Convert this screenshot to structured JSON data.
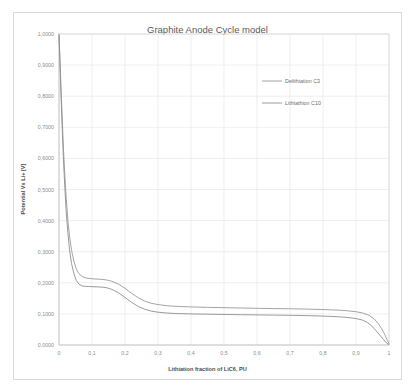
{
  "chart_data": {
    "type": "line",
    "title": "Graphite Anode Cycle model",
    "xlabel": "Lithiation fraction of LiC6, PU",
    "ylabel": "Potential Vs Li+ [V]",
    "xlim": [
      0,
      1
    ],
    "ylim": [
      0,
      1
    ],
    "grid": true,
    "legend_position": "inside-top-right",
    "xticks": [
      "0",
      "0,1",
      "0,2",
      "0,3",
      "0,4",
      "0,5",
      "0,6",
      "0,7",
      "0,8",
      "0,9",
      "1"
    ],
    "xtick_values": [
      0,
      0.1,
      0.2,
      0.3,
      0.4,
      0.5,
      0.6,
      0.7,
      0.8,
      0.9,
      1
    ],
    "yticks": [
      "0,0000",
      "0,1000",
      "0,2000",
      "0,3000",
      "0,4000",
      "0,5000",
      "0,6000",
      "0,7000",
      "0,8000",
      "0,9000",
      "1,0000"
    ],
    "ytick_values": [
      0,
      0.1,
      0.2,
      0.3,
      0.4,
      0.5,
      0.6,
      0.7,
      0.8,
      0.9,
      1
    ],
    "series": [
      {
        "name": "Delithiation C3",
        "color": "#9a9a9a",
        "x": [
          0.0,
          0.003,
          0.006,
          0.01,
          0.014,
          0.018,
          0.022,
          0.027,
          0.032,
          0.038,
          0.045,
          0.052,
          0.06,
          0.07,
          0.08,
          0.09,
          0.1,
          0.115,
          0.13,
          0.145,
          0.16,
          0.18,
          0.2,
          0.22,
          0.24,
          0.26,
          0.28,
          0.3,
          0.33,
          0.36,
          0.4,
          0.45,
          0.5,
          0.55,
          0.6,
          0.65,
          0.7,
          0.75,
          0.8,
          0.84,
          0.87,
          0.9,
          0.92,
          0.94,
          0.955,
          0.968,
          0.978,
          0.988,
          0.995,
          1.0
        ],
        "y": [
          1.0,
          0.92,
          0.83,
          0.72,
          0.62,
          0.54,
          0.47,
          0.4,
          0.35,
          0.305,
          0.27,
          0.245,
          0.23,
          0.22,
          0.216,
          0.214,
          0.213,
          0.212,
          0.211,
          0.209,
          0.205,
          0.196,
          0.182,
          0.166,
          0.152,
          0.141,
          0.134,
          0.13,
          0.126,
          0.124,
          0.1225,
          0.121,
          0.12,
          0.119,
          0.118,
          0.1172,
          0.1165,
          0.1155,
          0.114,
          0.1125,
          0.1105,
          0.107,
          0.103,
          0.095,
          0.084,
          0.068,
          0.052,
          0.032,
          0.015,
          0.004
        ]
      },
      {
        "name": "Lithiathion C10",
        "color": "#8f8f8f",
        "x": [
          0.0,
          0.003,
          0.006,
          0.01,
          0.014,
          0.018,
          0.022,
          0.027,
          0.032,
          0.038,
          0.045,
          0.052,
          0.06,
          0.07,
          0.08,
          0.09,
          0.1,
          0.115,
          0.13,
          0.145,
          0.16,
          0.18,
          0.2,
          0.22,
          0.24,
          0.26,
          0.28,
          0.3,
          0.33,
          0.36,
          0.4,
          0.45,
          0.5,
          0.55,
          0.6,
          0.65,
          0.7,
          0.75,
          0.8,
          0.84,
          0.87,
          0.9,
          0.92,
          0.935,
          0.948,
          0.96,
          0.972,
          0.983,
          0.992,
          1.0
        ],
        "y": [
          0.995,
          0.905,
          0.805,
          0.69,
          0.585,
          0.5,
          0.425,
          0.36,
          0.305,
          0.262,
          0.23,
          0.208,
          0.196,
          0.19,
          0.1885,
          0.188,
          0.1875,
          0.187,
          0.186,
          0.184,
          0.179,
          0.168,
          0.153,
          0.137,
          0.124,
          0.115,
          0.109,
          0.1055,
          0.1025,
          0.101,
          0.1,
          0.099,
          0.0982,
          0.0975,
          0.0968,
          0.0962,
          0.0955,
          0.0945,
          0.093,
          0.0912,
          0.089,
          0.085,
          0.08,
          0.072,
          0.061,
          0.047,
          0.032,
          0.018,
          0.007,
          0.001
        ]
      }
    ]
  },
  "legend": {
    "items": [
      {
        "label": "Delithiation C3"
      },
      {
        "label": "Lithiathion C10"
      }
    ]
  }
}
